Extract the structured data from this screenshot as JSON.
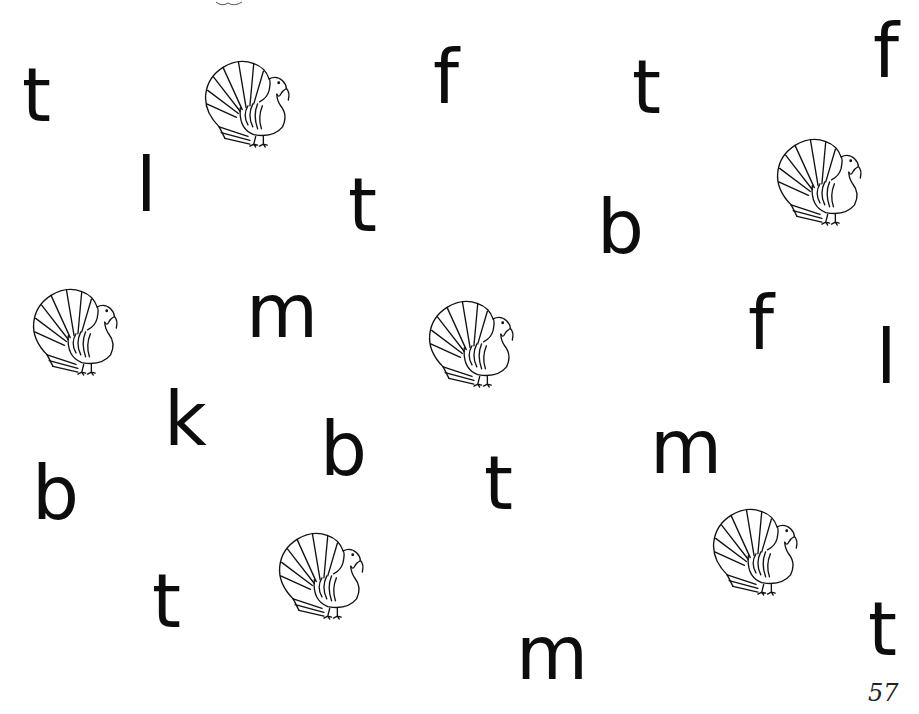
{
  "worksheet": {
    "page_number": "57",
    "letters": [
      {
        "char": "t",
        "x": 22,
        "y": 58,
        "size": 74
      },
      {
        "char": "l",
        "x": 136,
        "y": 148,
        "size": 74
      },
      {
        "char": "f",
        "x": 433,
        "y": 40,
        "size": 74
      },
      {
        "char": "t",
        "x": 348,
        "y": 168,
        "size": 74
      },
      {
        "char": "t",
        "x": 632,
        "y": 50,
        "size": 74
      },
      {
        "char": "f",
        "x": 873,
        "y": 14,
        "size": 74
      },
      {
        "char": "b",
        "x": 597,
        "y": 190,
        "size": 74
      },
      {
        "char": "m",
        "x": 246,
        "y": 274,
        "size": 74
      },
      {
        "char": "f",
        "x": 748,
        "y": 286,
        "size": 74
      },
      {
        "char": "l",
        "x": 876,
        "y": 320,
        "size": 74
      },
      {
        "char": "k",
        "x": 164,
        "y": 382,
        "size": 74
      },
      {
        "char": "b",
        "x": 320,
        "y": 412,
        "size": 74
      },
      {
        "char": "m",
        "x": 650,
        "y": 410,
        "size": 74
      },
      {
        "char": "b",
        "x": 32,
        "y": 456,
        "size": 74
      },
      {
        "char": "t",
        "x": 484,
        "y": 446,
        "size": 74
      },
      {
        "char": "t",
        "x": 152,
        "y": 564,
        "size": 74
      },
      {
        "char": "m",
        "x": 516,
        "y": 616,
        "size": 74
      },
      {
        "char": "t",
        "x": 868,
        "y": 592,
        "size": 74
      }
    ],
    "turkeys": [
      {
        "x": 200,
        "y": 52
      },
      {
        "x": 772,
        "y": 130
      },
      {
        "x": 28,
        "y": 280
      },
      {
        "x": 424,
        "y": 292
      },
      {
        "x": 274,
        "y": 524
      },
      {
        "x": 708,
        "y": 500
      }
    ]
  }
}
